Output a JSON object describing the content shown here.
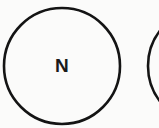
{
  "diagram": {
    "type": "circle-nodes",
    "nodes": [
      {
        "id": "left-circle",
        "label": "N",
        "cx": 62,
        "cy": 66,
        "r": 58
      },
      {
        "id": "right-circle",
        "label": "",
        "cx": 206,
        "cy": 66,
        "r": 58
      }
    ],
    "stroke_color": "#141414",
    "background_color": "#fbfbfa"
  }
}
